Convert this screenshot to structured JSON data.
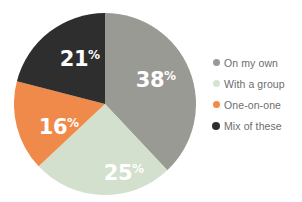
{
  "chart_data": {
    "type": "pie",
    "title": "",
    "subtitle": "",
    "xlabel": "",
    "ylabel": "",
    "grid": false,
    "legend_position": "right",
    "start_angle_deg": 0,
    "direction": "clockwise",
    "value_unit": "%",
    "total": 100,
    "categories": [
      "On my own",
      "With a group",
      "One-on-one",
      "Mix of these"
    ],
    "values": [
      38,
      25,
      16,
      21
    ],
    "colors": [
      "#9a9a94",
      "#d3e0cd",
      "#f08a4b",
      "#2e2e2e"
    ],
    "slices": [
      {
        "label": "On my own",
        "value": 38,
        "value_text": "38",
        "percent_symbol": "%",
        "color": "#9a9a94",
        "label_color": "#ffffff",
        "label_x": 142,
        "label_y": 74
      },
      {
        "label": "With a group",
        "value": 25,
        "value_text": "25",
        "percent_symbol": "%",
        "color": "#d3e0cd",
        "label_color": "#ffffff",
        "label_x": 110,
        "label_y": 167
      },
      {
        "label": "One-on-one",
        "value": 16,
        "value_text": "16",
        "percent_symbol": "%",
        "color": "#f08a4b",
        "label_color": "#ffffff",
        "label_x": 45,
        "label_y": 121
      },
      {
        "label": "Mix of these",
        "value": 21,
        "value_text": "21",
        "percent_symbol": "%",
        "color": "#2e2e2e",
        "label_color": "#ffffff",
        "label_x": 66,
        "label_y": 53
      }
    ]
  },
  "legend": {
    "items": [
      {
        "label": "On my own",
        "color": "#9a9a94",
        "dot_size": 7
      },
      {
        "label": "With a group",
        "color": "#d8e3d2",
        "dot_size": 7
      },
      {
        "label": "One-on-one",
        "color": "#f08a4b",
        "dot_size": 7
      },
      {
        "label": "Mix of these",
        "color": "#2e2e2e",
        "dot_size": 8
      }
    ]
  },
  "canvas": {
    "background": "#ffffff",
    "pie_center_x": 91,
    "pie_center_y": 91,
    "pie_radius": 91
  }
}
